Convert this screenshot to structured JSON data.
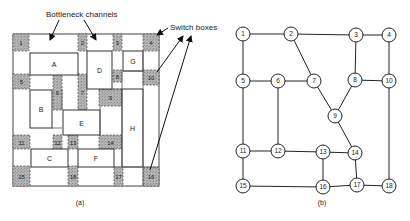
{
  "figure_a": {
    "caption": "(a)",
    "annotations": {
      "bottleneck": "Bottleneck channels",
      "switch": "Switch boxes"
    },
    "blocks": [
      {
        "id": "A",
        "x": 30,
        "y": 53,
        "w": 48,
        "h": 22
      },
      {
        "id": "B",
        "x": 30,
        "y": 90,
        "w": 22,
        "h": 38
      },
      {
        "id": "C",
        "x": 31,
        "y": 149,
        "w": 37,
        "h": 18
      },
      {
        "id": "D",
        "x": 87,
        "y": 51,
        "w": 25,
        "h": 38
      },
      {
        "id": "E",
        "x": 63,
        "y": 110,
        "w": 37,
        "h": 25
      },
      {
        "id": "F",
        "x": 78,
        "y": 149,
        "w": 36,
        "h": 18
      },
      {
        "id": "G",
        "x": 123,
        "y": 51,
        "w": 20,
        "h": 20
      },
      {
        "id": "H",
        "x": 122,
        "y": 89,
        "w": 21,
        "h": 78
      }
    ],
    "switch_boxes": [
      {
        "id": "1",
        "x": 13,
        "y": 34,
        "w": 16,
        "h": 17
      },
      {
        "id": "2",
        "x": 78,
        "y": 34,
        "w": 9,
        "h": 17
      },
      {
        "id": "3",
        "x": 113,
        "y": 34,
        "w": 9,
        "h": 17
      },
      {
        "id": "4",
        "x": 143,
        "y": 34,
        "w": 16,
        "h": 17
      },
      {
        "id": "5",
        "x": 13,
        "y": 74,
        "w": 17,
        "h": 15
      },
      {
        "id": "6",
        "x": 53,
        "y": 74,
        "w": 9,
        "h": 36
      },
      {
        "id": "7",
        "x": 78,
        "y": 74,
        "w": 9,
        "h": 36
      },
      {
        "id": "8",
        "x": 113,
        "y": 70,
        "w": 9,
        "h": 12
      },
      {
        "id": "9",
        "x": 99,
        "y": 89,
        "w": 23,
        "h": 17
      },
      {
        "id": "10",
        "x": 143,
        "y": 70,
        "w": 16,
        "h": 15
      },
      {
        "id": "11",
        "x": 13,
        "y": 135,
        "w": 17,
        "h": 14
      },
      {
        "id": "12",
        "x": 53,
        "y": 135,
        "w": 9,
        "h": 14
      },
      {
        "id": "13",
        "x": 68,
        "y": 135,
        "w": 10,
        "h": 14
      },
      {
        "id": "14",
        "x": 99,
        "y": 135,
        "w": 23,
        "h": 14
      },
      {
        "id": "15",
        "x": 13,
        "y": 166,
        "w": 17,
        "h": 20
      },
      {
        "id": "16",
        "x": 143,
        "y": 167,
        "w": 16,
        "h": 19
      },
      {
        "id": "17",
        "x": 114,
        "y": 167,
        "w": 9,
        "h": 19
      },
      {
        "id": "18",
        "x": 68,
        "y": 166,
        "w": 10,
        "h": 20
      }
    ]
  },
  "figure_b": {
    "caption": "(b)",
    "nodes": [
      {
        "id": "1",
        "x": 243,
        "y": 34
      },
      {
        "id": "2",
        "x": 291,
        "y": 34
      },
      {
        "id": "3",
        "x": 356,
        "y": 35
      },
      {
        "id": "4",
        "x": 389,
        "y": 35
      },
      {
        "id": "5",
        "x": 243,
        "y": 81
      },
      {
        "id": "6",
        "x": 278,
        "y": 81
      },
      {
        "id": "7",
        "x": 314,
        "y": 81
      },
      {
        "id": "8",
        "x": 355,
        "y": 80
      },
      {
        "id": "9",
        "x": 335,
        "y": 116
      },
      {
        "id": "10",
        "x": 389,
        "y": 81
      },
      {
        "id": "11",
        "x": 243,
        "y": 151
      },
      {
        "id": "12",
        "x": 278,
        "y": 151
      },
      {
        "id": "13",
        "x": 323,
        "y": 152
      },
      {
        "id": "14",
        "x": 355,
        "y": 153
      },
      {
        "id": "15",
        "x": 243,
        "y": 186
      },
      {
        "id": "16",
        "x": 323,
        "y": 187
      },
      {
        "id": "17",
        "x": 357,
        "y": 185
      },
      {
        "id": "18",
        "x": 389,
        "y": 186
      }
    ],
    "edges": [
      [
        "1",
        "2"
      ],
      [
        "2",
        "3"
      ],
      [
        "3",
        "4"
      ],
      [
        "1",
        "5"
      ],
      [
        "2",
        "7"
      ],
      [
        "3",
        "8"
      ],
      [
        "4",
        "10"
      ],
      [
        "5",
        "6"
      ],
      [
        "6",
        "7"
      ],
      [
        "8",
        "10"
      ],
      [
        "7",
        "9"
      ],
      [
        "8",
        "9"
      ],
      [
        "5",
        "11"
      ],
      [
        "6",
        "12"
      ],
      [
        "9",
        "14"
      ],
      [
        "10",
        "18"
      ],
      [
        "11",
        "12"
      ],
      [
        "12",
        "13"
      ],
      [
        "13",
        "14"
      ],
      [
        "11",
        "15"
      ],
      [
        "13",
        "16"
      ],
      [
        "14",
        "17"
      ],
      [
        "15",
        "16"
      ],
      [
        "16",
        "17"
      ],
      [
        "17",
        "18"
      ]
    ]
  }
}
